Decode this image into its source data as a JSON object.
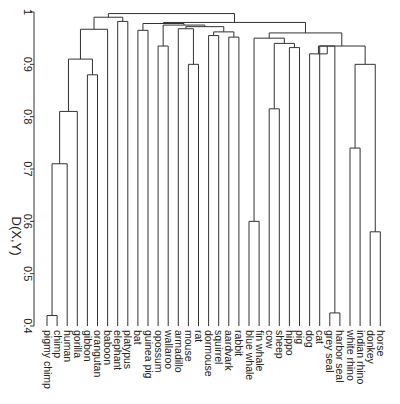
{
  "chart_data": {
    "type": "dendrogram",
    "title": "",
    "ylabel": "D(X,Y)",
    "xlabel": "",
    "ylim": [
      0.4,
      1.0
    ],
    "yticks": [
      0.4,
      0.5,
      0.6,
      0.7,
      0.8,
      0.9,
      1
    ],
    "ytick_labels": [
      "0.4",
      "0.5",
      "0.6",
      "0.7",
      "0.8",
      "0.9",
      "1"
    ],
    "leaves": [
      "pigmy chimp",
      "chimp",
      "human",
      "gorilla",
      "gibbon",
      "orangutan",
      "baboon",
      "elephant",
      "platypus",
      "bat",
      "guinea pig",
      "opossum",
      "wallaroo",
      "armadillo",
      "mouse",
      "rat",
      "dormouse",
      "squirrel",
      "aardvark",
      "rabbit",
      "blue whale",
      "fin whale",
      "cow",
      "sheep",
      "hippo",
      "pig",
      "dog",
      "cat",
      "grey seal",
      "harbor seal",
      "white rhino",
      "indian rhino",
      "donkey",
      "horse"
    ],
    "merges": [
      {
        "left": "pigmy chimp",
        "right": "chimp",
        "height": 0.42
      },
      {
        "left": "cluster:chimps",
        "right": "human",
        "height": 0.71
      },
      {
        "left": "cluster:hominini",
        "right": "gorilla",
        "height": 0.81
      },
      {
        "left": "gibbon",
        "right": "orangutan",
        "height": 0.88
      },
      {
        "left": "cluster:homininae",
        "right": "cluster:gibbon-orangutan",
        "height": 0.91
      },
      {
        "left": "cluster:apes",
        "right": "baboon",
        "height": 0.97
      },
      {
        "left": "elephant",
        "right": "platypus",
        "height": 0.98
      },
      {
        "left": "cluster:primates",
        "right": "cluster:elephant-platypus",
        "height": 0.99
      },
      {
        "left": "mouse",
        "right": "rat",
        "height": 0.9
      },
      {
        "left": "wallaroo",
        "right": "opossum",
        "height": 0.93
      },
      {
        "left": "squirrel",
        "right": "dormouse",
        "height": 0.95
      },
      {
        "left": "aardvark",
        "right": "rabbit",
        "height": 0.95
      },
      {
        "left": "bat",
        "right": "guinea pig",
        "height": 0.96
      },
      {
        "left": "blue whale",
        "right": "fin whale",
        "height": 0.6
      },
      {
        "left": "hippo",
        "right": "pig",
        "height": 0.93
      },
      {
        "left": "cow",
        "right": "sheep",
        "height": 0.81
      },
      {
        "left": "grey seal",
        "right": "harbor seal",
        "height": 0.42
      },
      {
        "left": "cat",
        "right": "cluster:seals",
        "height": 0.93
      },
      {
        "left": "dog",
        "right": "cluster:cat-seals",
        "height": 0.92
      },
      {
        "left": "white rhino",
        "right": "indian rhino",
        "height": 0.74
      },
      {
        "left": "donkey",
        "right": "horse",
        "height": 0.58
      },
      {
        "left": "cluster:rhinos",
        "right": "cluster:equids",
        "height": 0.9
      },
      {
        "left": "all-left",
        "right": "all-right",
        "height": 0.997
      }
    ]
  },
  "axis": {
    "ylabel": "D(X,Y)"
  }
}
